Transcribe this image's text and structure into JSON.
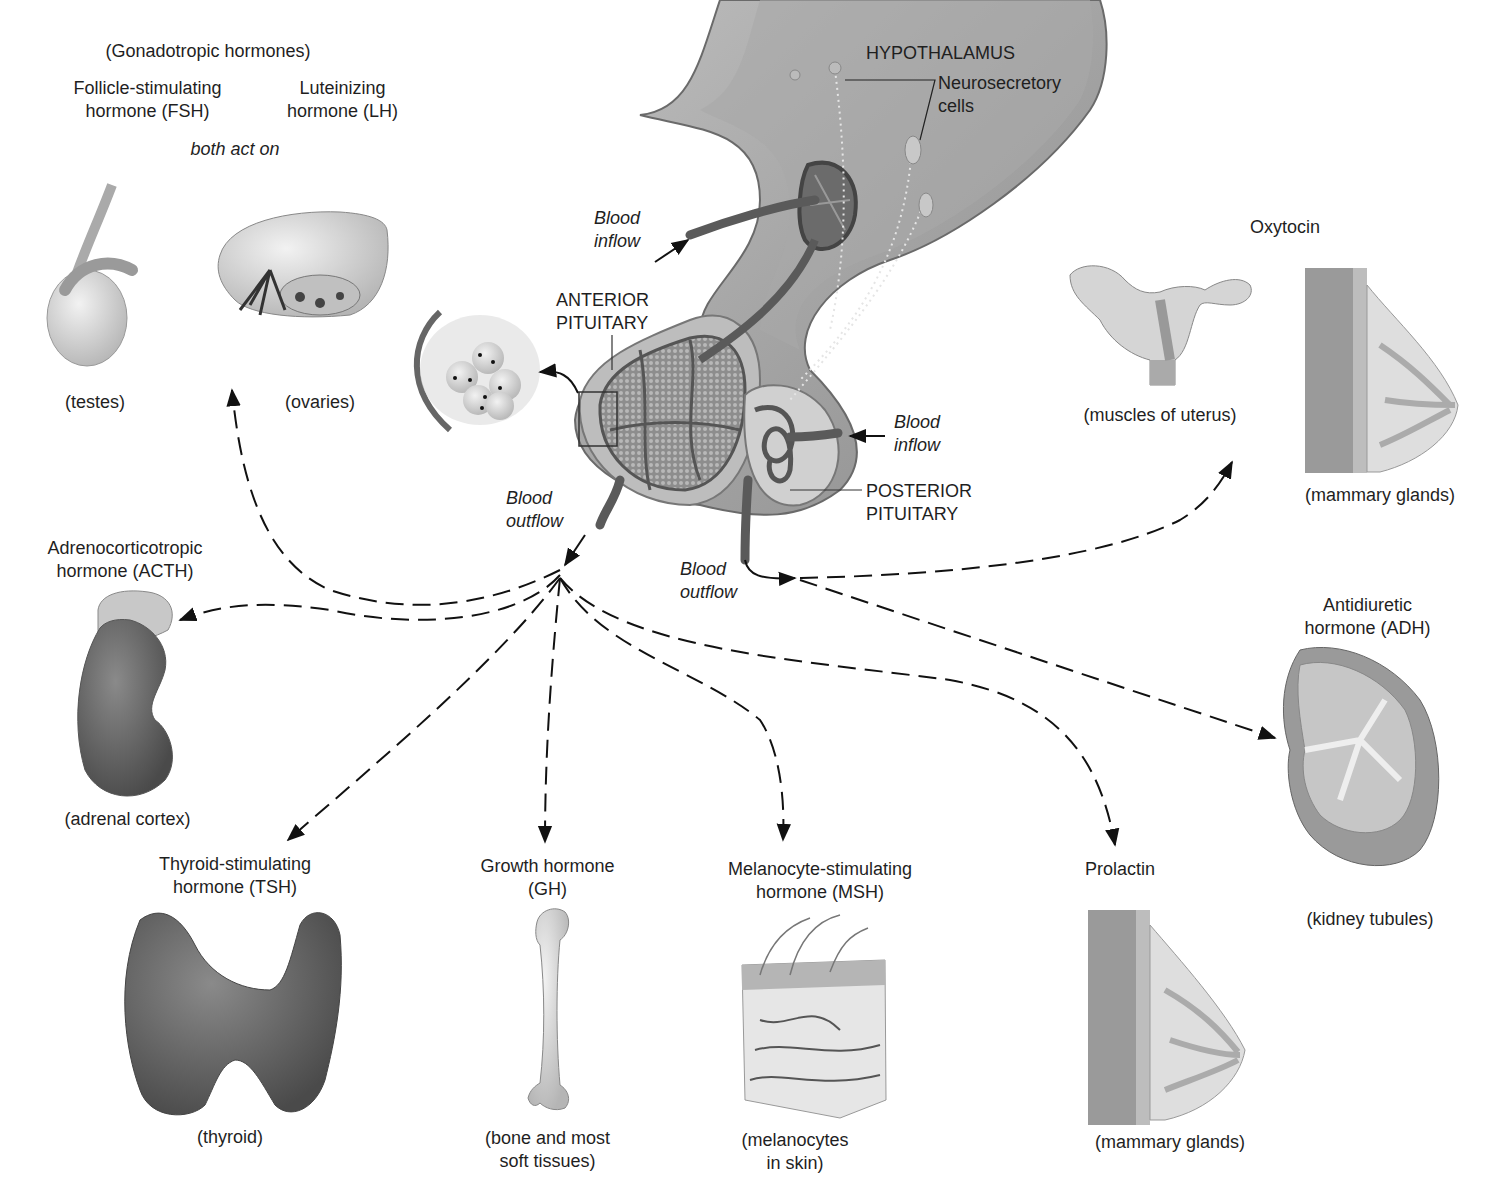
{
  "colors": {
    "background": "#ffffff",
    "text": "#1f1f1f",
    "tissue_light": "#cfcfcf",
    "tissue_mid": "#9a9a9a",
    "tissue_dark": "#5a5a5a",
    "arrow": "#111111"
  },
  "center": {
    "hypothalamus": "HYPOTHALAMUS",
    "neurosecretory": "Neurosecretory\ncells",
    "anterior_pituitary": "ANTERIOR\nPITUITARY",
    "posterior_pituitary": "POSTERIOR\nPITUITARY",
    "blood_inflow_anterior": "Blood\ninflow",
    "blood_inflow_posterior": "Blood\ninflow",
    "blood_outflow_anterior": "Blood\noutflow",
    "blood_outflow_posterior": "Blood\noutflow"
  },
  "anterior_hormones": [
    {
      "id": "gonadotropic",
      "group_label": "(Gonadotropic hormones)",
      "hormones": [
        "Follicle-stimulating\nhormone (FSH)",
        "Luteinizing\nhormone (LH)"
      ],
      "note": "both act on",
      "targets": [
        "(testes)",
        "(ovaries)"
      ]
    },
    {
      "id": "acth",
      "hormone": "Adrenocorticotropic\nhormone (ACTH)",
      "target": "(adrenal cortex)"
    },
    {
      "id": "tsh",
      "hormone": "Thyroid-stimulating\nhormone (TSH)",
      "target": "(thyroid)"
    },
    {
      "id": "gh",
      "hormone": "Growth hormone\n(GH)",
      "target": "(bone and most\nsoft tissues)"
    },
    {
      "id": "msh",
      "hormone": "Melanocyte-stimulating\nhormone (MSH)",
      "target": "(melanocytes\nin skin)"
    },
    {
      "id": "prolactin",
      "hormone": "Prolactin",
      "target": "(mammary glands)"
    }
  ],
  "posterior_hormones": [
    {
      "id": "oxytocin",
      "hormone": "Oxytocin",
      "targets": [
        "(muscles of uterus)",
        "(mammary glands)"
      ]
    },
    {
      "id": "adh",
      "hormone": "Antidiuretic\nhormone (ADH)",
      "target": "(kidney tubules)"
    }
  ],
  "icons": [
    "testis-illustration",
    "ovary-illustration",
    "kidney-adrenal-illustration",
    "thyroid-illustration",
    "femur-bone-illustration",
    "skin-block-illustration",
    "breast-illustration",
    "uterus-illustration",
    "kidney-section-illustration",
    "pituitary-illustration",
    "cell-cluster-inset"
  ]
}
